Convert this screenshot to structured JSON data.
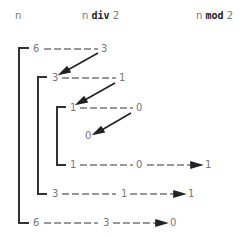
{
  "headers": {
    "n": "n",
    "div_prefix": "n",
    "div_op": "div",
    "div_suffix": "2",
    "mod_prefix": "n",
    "mod_op": "mod",
    "mod_suffix": "2"
  },
  "rows": {
    "r1": {
      "n": "6",
      "div": "3"
    },
    "r2": {
      "n": "3",
      "div": "1"
    },
    "r3": {
      "n": "1",
      "div": "0"
    },
    "base": {
      "n": "0"
    },
    "r4": {
      "n": "1",
      "div": "0",
      "mod": "1"
    },
    "r5": {
      "n": "3",
      "div": "1",
      "mod": "1"
    },
    "r6": {
      "n": "6",
      "div": "3",
      "mod": "0"
    }
  }
}
